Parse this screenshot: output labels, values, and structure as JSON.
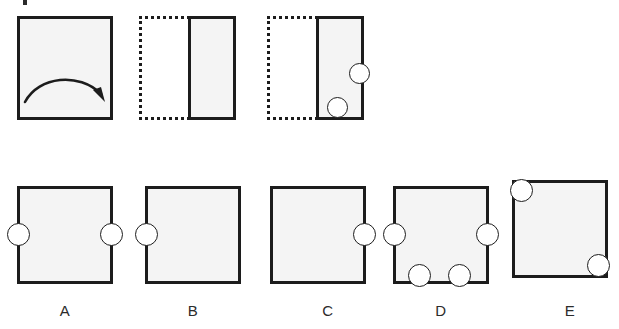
{
  "diagram": {
    "kind": "paper-folding-hole-punch-puzzle",
    "stem_label": "",
    "top_sequence": [
      {
        "step": 1,
        "name": "unfolded-sheet-with-fold-arrow",
        "shape": "square",
        "border_style": "solid",
        "annotation": "fold-arrow-left-to-right",
        "holes": []
      },
      {
        "step": 2,
        "name": "folded-sheet",
        "shape": "rectangle",
        "border_style": "solid",
        "ghost_outline": "dotted",
        "holes": []
      },
      {
        "step": 3,
        "name": "folded-sheet-punched",
        "shape": "rectangle",
        "border_style": "solid",
        "ghost_outline": "dotted",
        "holes": [
          {
            "edge": "right",
            "position": "upper-middle"
          },
          {
            "edge": "bottom",
            "position": "left-of-center"
          }
        ]
      }
    ],
    "options": [
      {
        "label": "A",
        "name": "option-a",
        "holes": [
          {
            "edge": "left",
            "position": "upper-middle"
          },
          {
            "edge": "right",
            "position": "upper-middle"
          }
        ]
      },
      {
        "label": "B",
        "name": "option-b",
        "holes": [
          {
            "edge": "left",
            "position": "upper-middle"
          }
        ]
      },
      {
        "label": "C",
        "name": "option-c",
        "holes": [
          {
            "edge": "right",
            "position": "upper-middle"
          }
        ]
      },
      {
        "label": "D",
        "name": "option-d",
        "holes": [
          {
            "edge": "left",
            "position": "upper-middle"
          },
          {
            "edge": "right",
            "position": "upper-middle"
          },
          {
            "edge": "bottom",
            "position": "left-of-center"
          },
          {
            "edge": "bottom",
            "position": "right-of-center"
          }
        ]
      },
      {
        "label": "E",
        "name": "option-e",
        "holes": [
          {
            "edge": "corner",
            "position": "top-left"
          },
          {
            "edge": "corner",
            "position": "bottom-right"
          }
        ]
      }
    ],
    "colors": {
      "ink": "#1c1c1c",
      "paper_fill": "#f4f4f4",
      "background": "#ffffff",
      "label_text": "#2b2b2b"
    }
  }
}
